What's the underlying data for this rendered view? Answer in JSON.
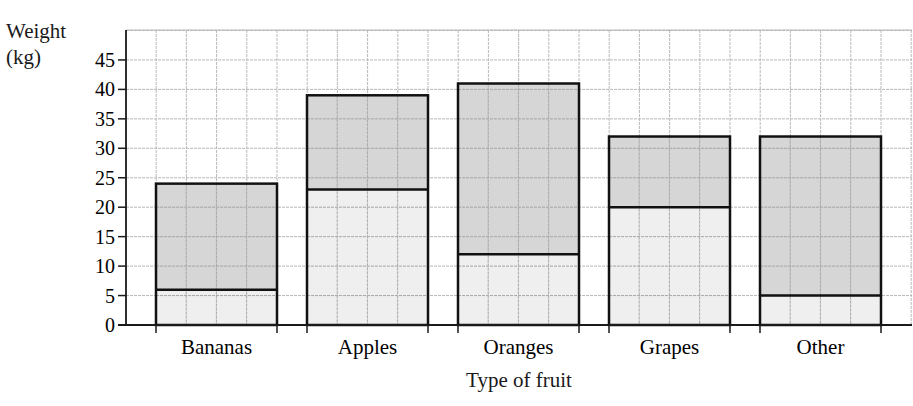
{
  "chart_data": {
    "type": "bar",
    "stacked": true,
    "title": "",
    "xlabel": "Type of fruit",
    "ylabel": "Weight (kg)",
    "ylabel_lines": [
      "Weight",
      "(kg)"
    ],
    "categories": [
      "Bananas",
      "Apples",
      "Oranges",
      "Grapes",
      "Other"
    ],
    "series": [
      {
        "name": "lower segment",
        "values": [
          6,
          23,
          12,
          20,
          5
        ],
        "color": "#ececec"
      },
      {
        "name": "upper segment",
        "values": [
          18,
          16,
          29,
          12,
          27
        ],
        "color": "#cfcfcf"
      }
    ],
    "totals": [
      24,
      39,
      41,
      32,
      32
    ],
    "yticks": [
      0,
      5,
      10,
      15,
      20,
      25,
      30,
      35,
      40,
      45
    ],
    "ylim": [
      0,
      50
    ],
    "grid": true,
    "legend": null
  },
  "colors": {
    "axis": "#1a1a1a",
    "grid": "#b8b8b8",
    "bar_outline": "#111111"
  }
}
